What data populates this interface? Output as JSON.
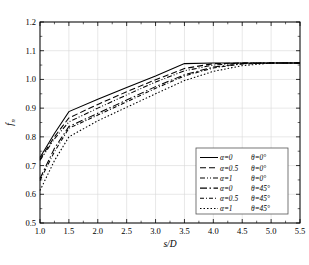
{
  "chart_data": {
    "type": "line",
    "title": "",
    "xlabel": "s/D",
    "ylabel": "f_n",
    "xlim": [
      1.0,
      5.5
    ],
    "ylim": [
      0.5,
      1.2
    ],
    "grid": true,
    "legend_position": "lower-right",
    "xticks": [
      "1.0",
      "1.5",
      "2.0",
      "2.5",
      "3.0",
      "3.5",
      "4.0",
      "4.5",
      "5.0",
      "5.5"
    ],
    "xtick_values": [
      1.0,
      1.5,
      2.0,
      2.5,
      3.0,
      3.5,
      4.0,
      4.5,
      5.0,
      5.5
    ],
    "yticks": [
      "0.5",
      "0.6",
      "0.7",
      "0.8",
      "0.9",
      "1.0",
      "1.1",
      "1.2"
    ],
    "ytick_values": [
      0.5,
      0.6,
      0.7,
      0.8,
      0.9,
      1.0,
      1.1,
      1.2
    ],
    "series": [
      {
        "name": "a=0 th=0",
        "alpha_label": "α=0",
        "theta_label": "θ=0°",
        "dash": "none",
        "x": [
          1.0,
          1.25,
          1.5,
          2.0,
          2.5,
          3.0,
          3.5,
          4.0,
          4.5,
          5.0,
          5.5
        ],
        "y": [
          0.728,
          0.812,
          0.888,
          0.931,
          0.972,
          1.012,
          1.055,
          1.057,
          1.057,
          1.057,
          1.057
        ]
      },
      {
        "name": "a=0.5 th=0",
        "alpha_label": "α=0.5",
        "theta_label": "θ=0°",
        "dash": "6,3",
        "x": [
          1.0,
          1.25,
          1.5,
          2.0,
          2.5,
          3.0,
          3.5,
          4.0,
          4.5,
          5.0,
          5.5
        ],
        "y": [
          0.722,
          0.8,
          0.866,
          0.913,
          0.957,
          0.999,
          1.038,
          1.055,
          1.057,
          1.057,
          1.057
        ]
      },
      {
        "name": "a=1 th=0",
        "alpha_label": "α=1",
        "theta_label": "θ=0°",
        "dash": "5,2,1,2,1,2",
        "x": [
          1.0,
          1.25,
          1.5,
          2.0,
          2.5,
          3.0,
          3.5,
          4.0,
          4.5,
          5.0,
          5.5
        ],
        "y": [
          0.718,
          0.793,
          0.852,
          0.9,
          0.946,
          0.991,
          1.03,
          1.05,
          1.057,
          1.057,
          1.057
        ]
      },
      {
        "name": "a=0 th=45",
        "alpha_label": "α=0",
        "theta_label": "θ=45°",
        "dash": "7,2.5,1.5,2.5",
        "x": [
          1.0,
          1.25,
          1.5,
          2.0,
          2.5,
          3.0,
          3.5,
          4.0,
          4.5,
          5.0,
          5.5
        ],
        "y": [
          0.655,
          0.76,
          0.836,
          0.882,
          0.928,
          0.975,
          1.016,
          1.043,
          1.055,
          1.057,
          1.057
        ]
      },
      {
        "name": "a=0.5 th=45",
        "alpha_label": "α=0.5",
        "theta_label": "θ=45°",
        "dash": "4,2,1,2",
        "x": [
          1.0,
          1.25,
          1.5,
          2.0,
          2.5,
          3.0,
          3.5,
          4.0,
          4.5,
          5.0,
          5.5
        ],
        "y": [
          0.648,
          0.748,
          0.83,
          0.876,
          0.922,
          0.969,
          1.012,
          1.04,
          1.054,
          1.057,
          1.057
        ]
      },
      {
        "name": "a=1 th=45",
        "alpha_label": "α=1",
        "theta_label": "θ=45°",
        "dash": "1.5,2",
        "x": [
          1.0,
          1.25,
          1.5,
          2.0,
          2.5,
          3.0,
          3.5,
          4.0,
          4.5,
          5.0,
          5.5
        ],
        "y": [
          0.613,
          0.717,
          0.8,
          0.856,
          0.903,
          0.95,
          0.996,
          1.028,
          1.048,
          1.057,
          1.057
        ]
      }
    ]
  },
  "legend": {
    "entries": [
      {
        "alpha": "α=0",
        "theta": "θ=0°"
      },
      {
        "alpha": "α=0.5",
        "theta": "θ=0°"
      },
      {
        "alpha": "α=1",
        "theta": "θ=0°"
      },
      {
        "alpha": "α=0",
        "theta": "θ=45°"
      },
      {
        "alpha": "α=0.5",
        "theta": "θ=45°"
      },
      {
        "alpha": "α=1",
        "theta": "θ=45°"
      }
    ]
  },
  "axis": {
    "y_label_main": "f",
    "y_label_sub": "n",
    "x_label": "s/D"
  }
}
